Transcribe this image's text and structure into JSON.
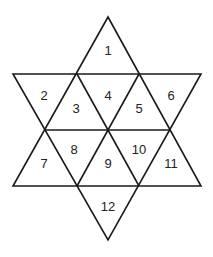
{
  "diagram": {
    "type": "hexagram-triangle-grid",
    "stroke_color": "#1a1a1a",
    "background": "#ffffff",
    "cells": [
      {
        "label": "1",
        "x": 108,
        "y": 52
      },
      {
        "label": "2",
        "x": 44,
        "y": 97
      },
      {
        "label": "3",
        "x": 76,
        "y": 110
      },
      {
        "label": "4",
        "x": 108,
        "y": 97
      },
      {
        "label": "5",
        "x": 139,
        "y": 110
      },
      {
        "label": "6",
        "x": 171,
        "y": 97
      },
      {
        "label": "7",
        "x": 44,
        "y": 165
      },
      {
        "label": "8",
        "x": 74,
        "y": 151
      },
      {
        "label": "9",
        "x": 108,
        "y": 165
      },
      {
        "label": "10",
        "x": 139,
        "y": 151
      },
      {
        "label": "11",
        "x": 171,
        "y": 165
      },
      {
        "label": "12",
        "x": 108,
        "y": 208
      }
    ]
  }
}
